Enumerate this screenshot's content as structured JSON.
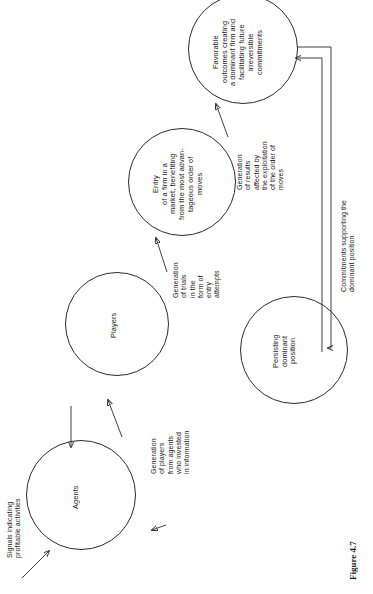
{
  "figure": {
    "caption": "Figure 4.7"
  },
  "nodes": [
    {
      "id": "agents",
      "label": "Agents"
    },
    {
      "id": "players",
      "label": "Players"
    },
    {
      "id": "entry",
      "label": "Entry\nof a firm in a\nmarket, benefiting\nfrom the most advan-\ntageous order of\nmoves"
    },
    {
      "id": "favorable",
      "label": "Favorable\noutcomes creating\na dominant firm and\nfacilitating future\nirreversible\ncommitments"
    },
    {
      "id": "persisting",
      "label": "Persisting\ndominant\nposition"
    }
  ],
  "edge_labels": [
    {
      "id": "signals",
      "text": "Signals indicating\nprofitable activities"
    },
    {
      "id": "generation-players",
      "text": "Generation\nof players\nfrom agents\nwho invested\nin information"
    },
    {
      "id": "generation-trials",
      "text": "Generation\nof trials\nin the\nform of\nentry\nattempts"
    },
    {
      "id": "generation-results",
      "text": "Generation\nof results\naffected by\nthe exploitation\nof the order of\nmoves"
    },
    {
      "id": "commitments",
      "text": "Commitments supporting the\ndominant position"
    }
  ],
  "colors": {
    "stroke": "#2b2b2b",
    "background": "#ffffff",
    "text": "#1a1a1a"
  }
}
